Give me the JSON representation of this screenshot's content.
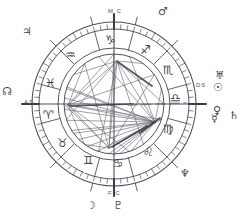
{
  "chart": {
    "type": "astrological-natal-wheel",
    "style": "hand-drawn sketch, monochrome ink on white",
    "center": {
      "x": 114,
      "y": 104
    },
    "radii": {
      "outer_rim": 82,
      "tick_ring": 75,
      "sign_ring_inner": 56,
      "aspect_disc": 50
    },
    "ink_color": "#4a4a52",
    "background": "#ffffff"
  },
  "angles": [
    {
      "name": "midheaven",
      "tag": "M C",
      "position": "top",
      "x": 108,
      "y": 8
    },
    {
      "name": "imum-coeli",
      "tag": "F C",
      "position": "bottom",
      "x": 108,
      "y": 190
    },
    {
      "name": "ascendant",
      "tag": "AS",
      "position": "left",
      "x": 24,
      "y": 99
    },
    {
      "name": "descendant",
      "tag": "DS",
      "position": "right",
      "x": 196,
      "y": 82
    }
  ],
  "signs": [
    {
      "name": "capricorn",
      "glyph": "♑",
      "angle_deg": 255,
      "label_x": 112,
      "label_y": 42
    },
    {
      "name": "sagittarius",
      "glyph": "♐",
      "angle_deg": 285,
      "label_x": 147,
      "label_y": 52
    },
    {
      "name": "scorpio",
      "glyph": "♏",
      "angle_deg": 315,
      "label_x": 170,
      "label_y": 72
    },
    {
      "name": "libra",
      "glyph": "♎",
      "angle_deg": 345,
      "label_x": 177,
      "label_y": 100
    },
    {
      "name": "virgo",
      "glyph": "♍",
      "angle_deg": 15,
      "label_x": 170,
      "label_y": 131
    },
    {
      "name": "leo",
      "glyph": "♌",
      "angle_deg": 45,
      "label_x": 150,
      "label_y": 154
    },
    {
      "name": "cancer",
      "glyph": "♋",
      "angle_deg": 75,
      "label_x": 120,
      "label_y": 165
    },
    {
      "name": "gemini",
      "glyph": "♊",
      "angle_deg": 105,
      "label_x": 90,
      "label_y": 162
    },
    {
      "name": "taurus",
      "glyph": "♉",
      "angle_deg": 135,
      "label_x": 64,
      "label_y": 145
    },
    {
      "name": "aries",
      "glyph": "♈",
      "angle_deg": 165,
      "label_x": 50,
      "label_y": 117
    },
    {
      "name": "pisces",
      "glyph": "♓",
      "angle_deg": 195,
      "label_x": 52,
      "label_y": 85
    },
    {
      "name": "aquarius",
      "glyph": "♒",
      "angle_deg": 225,
      "label_x": 72,
      "label_y": 57
    }
  ],
  "planets": [
    {
      "name": "mars",
      "glyph": "♂",
      "x": 158,
      "y": 6,
      "location": "outside-top-right"
    },
    {
      "name": "jupiter",
      "glyph": "♃",
      "x": 22,
      "y": 26,
      "location": "outside-top-left"
    },
    {
      "name": "north-node",
      "glyph": "☊",
      "x": 2,
      "y": 86,
      "location": "outside-left"
    },
    {
      "name": "uranus",
      "glyph": "♅",
      "x": 215,
      "y": 70,
      "location": "outside-right-upper"
    },
    {
      "name": "sun",
      "glyph": "☉",
      "x": 213,
      "y": 82,
      "location": "outside-right"
    },
    {
      "name": "venus",
      "glyph": "♀",
      "x": 213,
      "y": 105,
      "location": "outside-right-lower"
    },
    {
      "name": "mercury",
      "glyph": "☿",
      "x": 211,
      "y": 113,
      "location": "outside-right-lower"
    },
    {
      "name": "saturn",
      "glyph": "♄",
      "x": 229,
      "y": 110,
      "location": "outside-right-far"
    },
    {
      "name": "neptune",
      "glyph": "♆",
      "x": 180,
      "y": 168,
      "location": "outside-bottom-right"
    },
    {
      "name": "moon",
      "glyph": "☽",
      "x": 86,
      "y": 200,
      "location": "outside-bottom"
    },
    {
      "name": "pluto",
      "glyph": "♇",
      "x": 113,
      "y": 200,
      "location": "outside-bottom"
    }
  ],
  "aspect_hubs": [
    {
      "name": "ascendant-hub",
      "x": 68,
      "y": 105
    },
    {
      "name": "midheaven-hub",
      "x": 117,
      "y": 61
    },
    {
      "name": "descendant-hub",
      "x": 155,
      "y": 122
    },
    {
      "name": "lower-hub",
      "x": 109,
      "y": 148
    }
  ]
}
